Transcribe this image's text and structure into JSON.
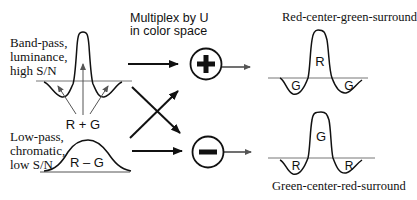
{
  "labels": {
    "bandpass": [
      "Band-pass,",
      "luminance,",
      "high S/N"
    ],
    "lowpass": [
      "Low-pass,",
      "chromatic,",
      "low S/N"
    ],
    "multiplex": [
      "Multiplex by U",
      "in color space"
    ],
    "top_right_title": "Red-center-green-surround",
    "bottom_right_title": "Green-center-red-surround"
  },
  "curve_labels": {
    "bandpass_sum": "R + G",
    "lowpass_diff": "R – G",
    "top_center": "R",
    "top_surround_left": "G",
    "top_surround_right": "G",
    "bottom_center": "G",
    "bottom_surround_left": "R",
    "bottom_surround_right": "R"
  },
  "operators": {
    "plus": "plus-operator",
    "minus": "minus-operator"
  },
  "colors": {
    "ink": "#111111",
    "baseline": "#777777",
    "background": "#ffffff"
  }
}
